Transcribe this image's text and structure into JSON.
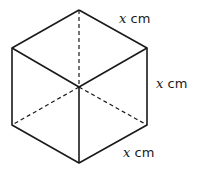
{
  "figure": {
    "type": "cube",
    "stroke_color": "#1a1a1a",
    "labels": [
      {
        "variable": "x",
        "unit": "cm",
        "edge": "top-right"
      },
      {
        "variable": "x",
        "unit": "cm",
        "edge": "right-vertical"
      },
      {
        "variable": "x",
        "unit": "cm",
        "edge": "bottom-right"
      }
    ]
  }
}
